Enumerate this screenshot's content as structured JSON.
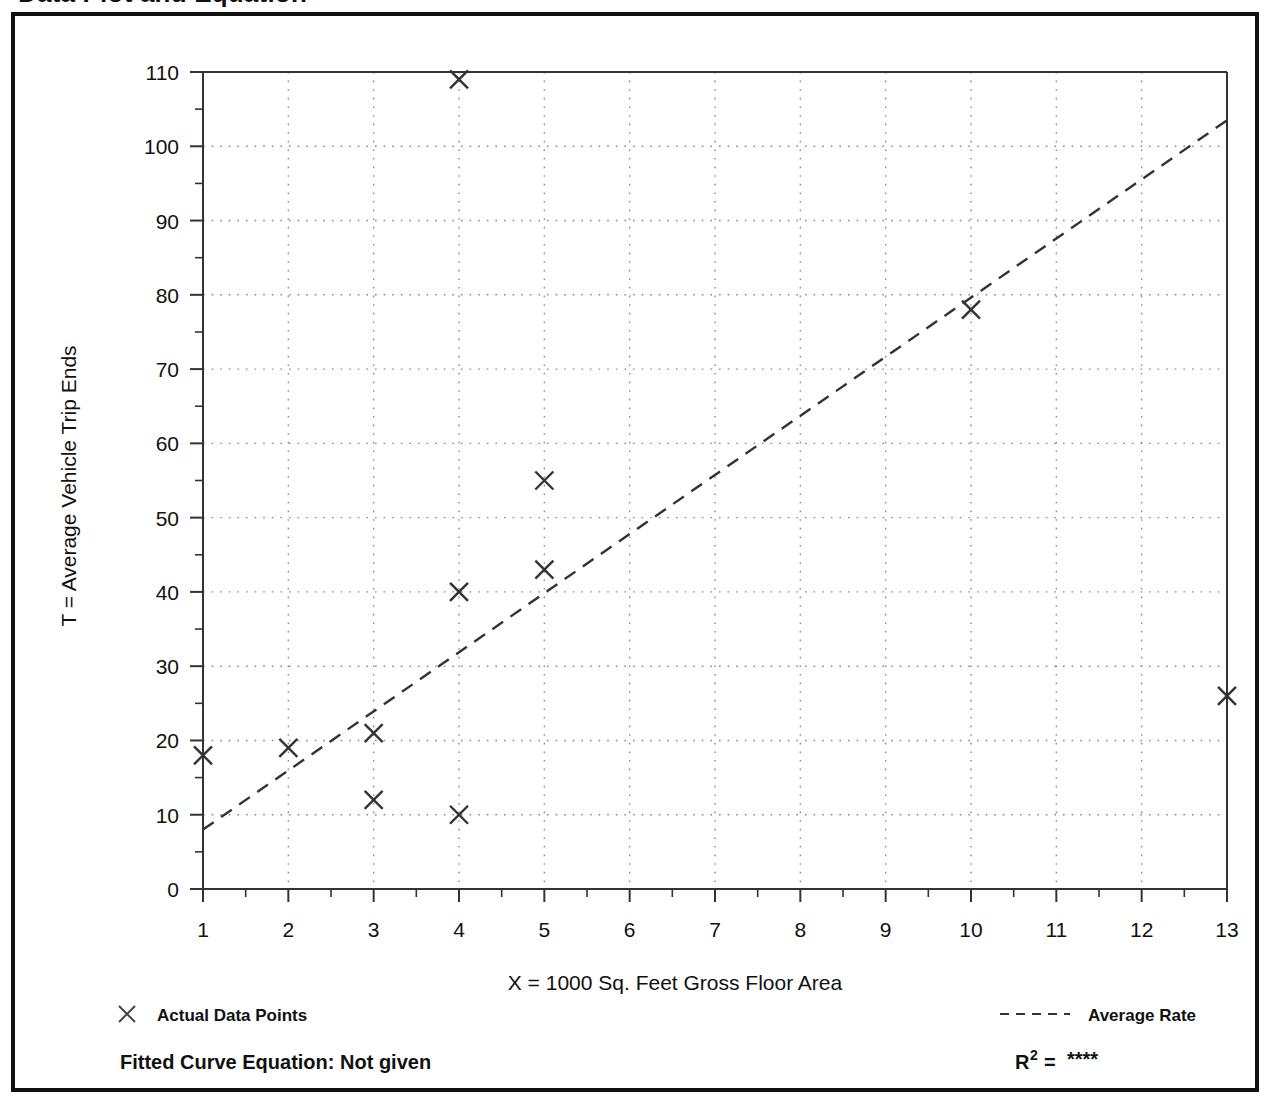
{
  "page": {
    "title": "Data Plot and Equation"
  },
  "chart_data": {
    "type": "scatter",
    "title": "",
    "xlabel": "X = 1000 Sq. Feet Gross Floor Area",
    "ylabel": "T = Average Vehicle Trip Ends",
    "xlim": [
      1,
      13
    ],
    "ylim": [
      0,
      110
    ],
    "xticks": [
      1,
      2,
      3,
      4,
      5,
      6,
      7,
      8,
      9,
      10,
      11,
      12,
      13
    ],
    "xtick_labels": [
      "1",
      "2",
      "3",
      "4",
      "5",
      "6",
      "7",
      "8",
      "9",
      "10",
      "11",
      "12",
      "13"
    ],
    "yticks": [
      0,
      10,
      20,
      30,
      40,
      50,
      60,
      70,
      80,
      90,
      100,
      110
    ],
    "ytick_labels": [
      "0",
      "10",
      "20",
      "30",
      "40",
      "50",
      "60",
      "70",
      "80",
      "90",
      "100",
      "110"
    ],
    "y_minor_tick_step": 5,
    "x_minor_tick_step": 0.5,
    "grid": true,
    "grid_style": "dotted",
    "marker": "x",
    "marker_color": "#333333",
    "line_color": "#333333",
    "legend_position": "below-axes",
    "series": [
      {
        "name": "Actual Data Points",
        "type": "scatter",
        "points": [
          {
            "x": 1,
            "y": 18
          },
          {
            "x": 2,
            "y": 19
          },
          {
            "x": 3,
            "y": 21
          },
          {
            "x": 3,
            "y": 12
          },
          {
            "x": 4,
            "y": 109
          },
          {
            "x": 4,
            "y": 40
          },
          {
            "x": 4,
            "y": 10
          },
          {
            "x": 5,
            "y": 55
          },
          {
            "x": 5,
            "y": 43
          },
          {
            "x": 10,
            "y": 78
          },
          {
            "x": 13,
            "y": 26
          }
        ]
      },
      {
        "name": "Average Rate",
        "type": "line",
        "style": "dashed",
        "endpoints": [
          {
            "x": 1,
            "y": 8
          },
          {
            "x": 13,
            "y": 103.5
          }
        ]
      }
    ]
  },
  "legend": {
    "items": [
      {
        "label": "Actual Data Points",
        "marker": "x-marker"
      },
      {
        "label": "Average Rate",
        "marker": "dashed-line"
      }
    ]
  },
  "footer": {
    "equation_label": "Fitted Curve Equation:  Not given",
    "r_squared_label": "R",
    "r_squared_exponent": "2",
    "r_squared_equals": "=",
    "r_squared_value": "****"
  }
}
